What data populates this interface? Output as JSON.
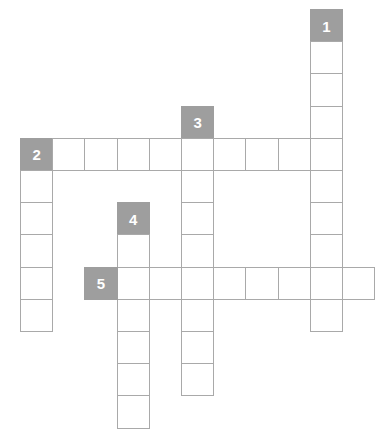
{
  "puzzle": {
    "title": "Crossword Grid",
    "grid": {
      "origin_x": 20,
      "origin_y": 9,
      "cell_size": 32.2,
      "columns": 11,
      "rows": 13,
      "cell_fill_color": "#ffffff",
      "clue_fill_color": "#9e9e9e",
      "border_color": "#a9a9a9",
      "number_color": "#ffffff",
      "background_color": "#ffffff"
    },
    "clue_numbers": [
      "1",
      "2",
      "3",
      "4",
      "5"
    ],
    "entries": [
      {
        "number": "1",
        "direction": "down",
        "start_col": 9,
        "start_row": 0,
        "length": 10
      },
      {
        "number": "2",
        "direction": "across",
        "start_col": 0,
        "start_row": 4,
        "length": 10
      },
      {
        "number": "3",
        "direction": "down",
        "start_col": 5,
        "start_row": 3,
        "length": 10
      },
      {
        "number": "4",
        "direction": "down",
        "start_col": 3,
        "start_row": 6,
        "length": 7
      },
      {
        "number": "5",
        "direction": "across",
        "start_col": 2,
        "start_row": 8,
        "length": 9
      },
      {
        "number": "2b",
        "direction": "down",
        "start_col": 0,
        "start_row": 4,
        "length": 6
      }
    ],
    "cells": [
      {
        "col": 9,
        "row": 0,
        "clue": true,
        "number": "1"
      },
      {
        "col": 9,
        "row": 1,
        "clue": false,
        "number": ""
      },
      {
        "col": 9,
        "row": 2,
        "clue": false,
        "number": ""
      },
      {
        "col": 9,
        "row": 3,
        "clue": false,
        "number": ""
      },
      {
        "col": 9,
        "row": 4,
        "clue": false,
        "number": ""
      },
      {
        "col": 9,
        "row": 5,
        "clue": false,
        "number": ""
      },
      {
        "col": 9,
        "row": 6,
        "clue": false,
        "number": ""
      },
      {
        "col": 9,
        "row": 7,
        "clue": false,
        "number": ""
      },
      {
        "col": 9,
        "row": 8,
        "clue": false,
        "number": ""
      },
      {
        "col": 9,
        "row": 9,
        "clue": false,
        "number": ""
      },
      {
        "col": 5,
        "row": 3,
        "clue": true,
        "number": "3"
      },
      {
        "col": 5,
        "row": 4,
        "clue": false,
        "number": ""
      },
      {
        "col": 5,
        "row": 5,
        "clue": false,
        "number": ""
      },
      {
        "col": 5,
        "row": 6,
        "clue": false,
        "number": ""
      },
      {
        "col": 5,
        "row": 7,
        "clue": false,
        "number": ""
      },
      {
        "col": 5,
        "row": 8,
        "clue": false,
        "number": ""
      },
      {
        "col": 5,
        "row": 9,
        "clue": false,
        "number": ""
      },
      {
        "col": 5,
        "row": 10,
        "clue": false,
        "number": ""
      },
      {
        "col": 5,
        "row": 11,
        "clue": false,
        "number": ""
      },
      {
        "col": 0,
        "row": 4,
        "clue": true,
        "number": "2"
      },
      {
        "col": 1,
        "row": 4,
        "clue": false,
        "number": ""
      },
      {
        "col": 2,
        "row": 4,
        "clue": false,
        "number": ""
      },
      {
        "col": 3,
        "row": 4,
        "clue": false,
        "number": ""
      },
      {
        "col": 4,
        "row": 4,
        "clue": false,
        "number": ""
      },
      {
        "col": 6,
        "row": 4,
        "clue": false,
        "number": ""
      },
      {
        "col": 7,
        "row": 4,
        "clue": false,
        "number": ""
      },
      {
        "col": 8,
        "row": 4,
        "clue": false,
        "number": ""
      },
      {
        "col": 0,
        "row": 5,
        "clue": false,
        "number": ""
      },
      {
        "col": 0,
        "row": 6,
        "clue": false,
        "number": ""
      },
      {
        "col": 0,
        "row": 7,
        "clue": false,
        "number": ""
      },
      {
        "col": 0,
        "row": 8,
        "clue": false,
        "number": ""
      },
      {
        "col": 0,
        "row": 9,
        "clue": false,
        "number": ""
      },
      {
        "col": 3,
        "row": 6,
        "clue": true,
        "number": "4"
      },
      {
        "col": 3,
        "row": 7,
        "clue": false,
        "number": ""
      },
      {
        "col": 3,
        "row": 8,
        "clue": false,
        "number": ""
      },
      {
        "col": 3,
        "row": 9,
        "clue": false,
        "number": ""
      },
      {
        "col": 3,
        "row": 10,
        "clue": false,
        "number": ""
      },
      {
        "col": 3,
        "row": 11,
        "clue": false,
        "number": ""
      },
      {
        "col": 3,
        "row": 12,
        "clue": false,
        "number": ""
      },
      {
        "col": 2,
        "row": 8,
        "clue": true,
        "number": "5"
      },
      {
        "col": 4,
        "row": 8,
        "clue": false,
        "number": ""
      },
      {
        "col": 6,
        "row": 8,
        "clue": false,
        "number": ""
      },
      {
        "col": 7,
        "row": 8,
        "clue": false,
        "number": ""
      },
      {
        "col": 8,
        "row": 8,
        "clue": false,
        "number": ""
      },
      {
        "col": 10,
        "row": 8,
        "clue": false,
        "number": ""
      }
    ]
  }
}
